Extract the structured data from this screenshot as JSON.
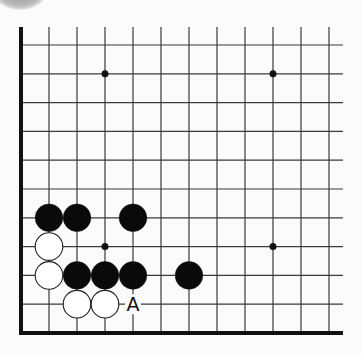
{
  "board": {
    "columns": 12,
    "rows": 11,
    "origin": {
      "x": 21,
      "y": 45
    },
    "spacing_x": 28,
    "spacing_y": 28.8,
    "top_line_start_y": 27,
    "right_line_end_x": 343,
    "edges": [
      "left",
      "bottom"
    ],
    "colors": {
      "line": "#3a3a3a",
      "edge": "#111111",
      "black": "#0a0a0a",
      "white": "#ffffff",
      "background": "#fbfbfb"
    }
  },
  "star_points": [
    {
      "col": 3,
      "row": 1
    },
    {
      "col": 9,
      "row": 1
    },
    {
      "col": 3,
      "row": 7
    },
    {
      "col": 9,
      "row": 7
    }
  ],
  "stones": [
    {
      "color": "black",
      "col": 1,
      "row": 6
    },
    {
      "color": "black",
      "col": 2,
      "row": 6
    },
    {
      "color": "black",
      "col": 4,
      "row": 6
    },
    {
      "color": "white",
      "col": 1,
      "row": 7
    },
    {
      "color": "white",
      "col": 1,
      "row": 8
    },
    {
      "color": "black",
      "col": 2,
      "row": 8
    },
    {
      "color": "black",
      "col": 3,
      "row": 8
    },
    {
      "color": "black",
      "col": 4,
      "row": 8
    },
    {
      "color": "black",
      "col": 6,
      "row": 8
    },
    {
      "color": "white",
      "col": 2,
      "row": 9
    },
    {
      "color": "white",
      "col": 3,
      "row": 9
    }
  ],
  "labels": [
    {
      "text": "A",
      "col": 4,
      "row": 9
    }
  ]
}
